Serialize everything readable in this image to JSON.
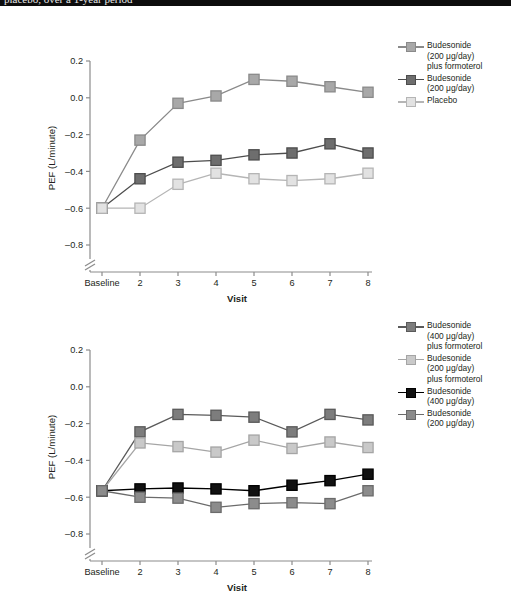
{
  "page": {
    "cutoff_text": "placebo, over a 1-year period",
    "background": "#ffffff"
  },
  "panel_a": {
    "xlabel": "Visit",
    "ylabel": "PEF (L/minute)",
    "legend": [
      {
        "label_lines": [
          "Budesonide",
          "(200 μg/day)",
          "plus formoterol"
        ],
        "fill": "#a8a8a8",
        "stroke": "#8a8a8a"
      },
      {
        "label_lines": [
          "Budesonide",
          "(200 μg/day)"
        ],
        "fill": "#6e6e6e",
        "stroke": "#4d4d4d"
      },
      {
        "label_lines": [
          "Placebo"
        ],
        "fill": "#e2e2e2",
        "stroke": "#b5b5b5"
      }
    ]
  },
  "panel_b": {
    "xlabel": "Visit",
    "ylabel": "PEF (L/minute)",
    "legend": [
      {
        "label_lines": [
          "Budesonide",
          "(400 μg/day)",
          "plus formoterol"
        ],
        "fill": "#7d7d7d",
        "stroke": "#5a5a5a"
      },
      {
        "label_lines": [
          "Budesonide",
          "(200 μg/day)",
          "plus formoterol"
        ],
        "fill": "#c9c9c9",
        "stroke": "#a5a5a5"
      },
      {
        "label_lines": [
          "Budesonide",
          "(400 μg/day)"
        ],
        "fill": "#111111",
        "stroke": "#000000"
      },
      {
        "label_lines": [
          "Budesonide",
          "(200 μg/day)"
        ],
        "fill": "#8c8c8c",
        "stroke": "#6b6b6b"
      }
    ]
  },
  "chart_data": [
    {
      "type": "line",
      "id": "panel-a",
      "title": "",
      "xlabel": "Visit",
      "ylabel": "PEF (L/minute)",
      "categories": [
        "Baseline",
        "2",
        "3",
        "4",
        "5",
        "6",
        "7",
        "8"
      ],
      "yticks": [
        0.2,
        0.0,
        -0.2,
        -0.4,
        -0.6,
        -0.8
      ],
      "ytick_labels": [
        "0.2",
        "0.0",
        "–0.2",
        "–0.4",
        "–0.6",
        "–0.8"
      ],
      "ylim": [
        -0.85,
        0.22
      ],
      "axis_break": true,
      "grid": false,
      "legend_position": "right",
      "series": [
        {
          "name": "Budesonide (200 μg/day) plus formoterol",
          "fill": "#a8a8a8",
          "stroke": "#8a8a8a",
          "values": [
            -0.6,
            -0.23,
            -0.03,
            0.01,
            0.1,
            0.09,
            0.06,
            0.03
          ]
        },
        {
          "name": "Budesonide (200 μg/day)",
          "fill": "#6e6e6e",
          "stroke": "#4d4d4d",
          "values": [
            -0.6,
            -0.44,
            -0.35,
            -0.34,
            -0.31,
            -0.3,
            -0.25,
            -0.3
          ]
        },
        {
          "name": "Placebo",
          "fill": "#e2e2e2",
          "stroke": "#b5b5b5",
          "values": [
            -0.6,
            -0.6,
            -0.47,
            -0.41,
            -0.44,
            -0.45,
            -0.44,
            -0.41
          ]
        }
      ]
    },
    {
      "type": "line",
      "id": "panel-b",
      "title": "",
      "xlabel": "Visit",
      "ylabel": "PEF (L/minute)",
      "categories": [
        "Baseline",
        "2",
        "3",
        "4",
        "5",
        "6",
        "7",
        "8"
      ],
      "yticks": [
        0.2,
        0.0,
        -0.2,
        -0.4,
        -0.6,
        -0.8
      ],
      "ytick_labels": [
        "0.2",
        "0.0",
        "–0.2",
        "–0.4",
        "–0.6",
        "–0.8"
      ],
      "ylim": [
        -0.85,
        0.22
      ],
      "axis_break": true,
      "grid": false,
      "legend_position": "right",
      "series": [
        {
          "name": "Budesonide (400 μg/day) plus formoterol",
          "fill": "#7d7d7d",
          "stroke": "#5a5a5a",
          "values": [
            -0.565,
            -0.245,
            -0.15,
            -0.155,
            -0.165,
            -0.245,
            -0.15,
            -0.18
          ]
        },
        {
          "name": "Budesonide (200 μg/day) plus formoterol",
          "fill": "#c9c9c9",
          "stroke": "#a5a5a5",
          "values": [
            -0.565,
            -0.305,
            -0.325,
            -0.355,
            -0.29,
            -0.335,
            -0.3,
            -0.33
          ]
        },
        {
          "name": "Budesonide (400 μg/day)",
          "fill": "#111111",
          "stroke": "#000000",
          "values": [
            -0.565,
            -0.555,
            -0.55,
            -0.555,
            -0.565,
            -0.535,
            -0.51,
            -0.475
          ]
        },
        {
          "name": "Budesonide (200 μg/day)",
          "fill": "#8c8c8c",
          "stroke": "#6b6b6b",
          "values": [
            -0.565,
            -0.6,
            -0.605,
            -0.655,
            -0.635,
            -0.63,
            -0.635,
            -0.565
          ]
        }
      ]
    }
  ]
}
